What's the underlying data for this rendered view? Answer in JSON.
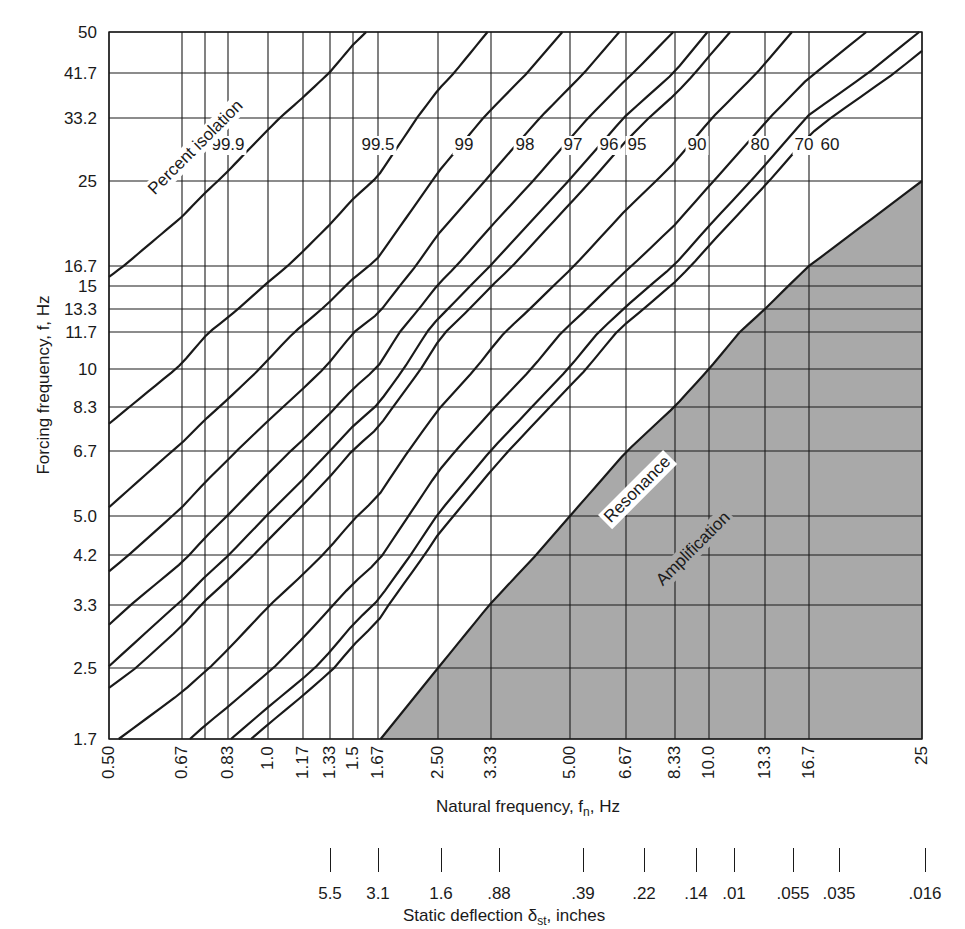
{
  "chart_data": {
    "type": "line",
    "title": "",
    "xlabel": "Natural frequency, fₙ, Hz",
    "ylabel": "Forcing frequency, f, Hz",
    "secondary_xlabel": "Static deflection δst, inches",
    "xscale": "log",
    "yscale": "log",
    "xlim": [
      0.5,
      25
    ],
    "ylim": [
      1.7,
      50
    ],
    "grid": true,
    "x_ticks": [
      {
        "value": 0.5,
        "label": "0.50",
        "px": 109
      },
      {
        "value": 0.67,
        "label": "0.67",
        "px": 182
      },
      {
        "value": 0.75,
        "label": "",
        "px": 205
      },
      {
        "value": 0.83,
        "label": "0.83",
        "px": 228
      },
      {
        "value": 1.0,
        "label": "1.0",
        "px": 268
      },
      {
        "value": 1.17,
        "label": "1.17",
        "px": 303
      },
      {
        "value": 1.33,
        "label": "1.33",
        "px": 330
      },
      {
        "value": 1.5,
        "label": "1.5",
        "px": 353
      },
      {
        "value": 1.67,
        "label": "1.67",
        "px": 378
      },
      {
        "value": 2.5,
        "label": "2.50",
        "px": 438
      },
      {
        "value": 3.33,
        "label": "3.33",
        "px": 491
      },
      {
        "value": 5.0,
        "label": "5.00",
        "px": 570
      },
      {
        "value": 6.67,
        "label": "6.67",
        "px": 626
      },
      {
        "value": 8.33,
        "label": "8.33",
        "px": 675
      },
      {
        "value": 10.0,
        "label": "10.0",
        "px": 709
      },
      {
        "value": 13.3,
        "label": "13.3",
        "px": 765
      },
      {
        "value": 16.7,
        "label": "16.7",
        "px": 809
      },
      {
        "value": 25,
        "label": "25",
        "px": 922
      }
    ],
    "y_ticks": [
      {
        "value": 50,
        "label": "50",
        "px": 32
      },
      {
        "value": 41.7,
        "label": "41.7",
        "px": 73
      },
      {
        "value": 33.2,
        "label": "33.2",
        "px": 118
      },
      {
        "value": 25,
        "label": "25",
        "px": 181
      },
      {
        "value": 16.7,
        "label": "16.7",
        "px": 266
      },
      {
        "value": 15,
        "label": "15",
        "px": 286
      },
      {
        "value": 13.3,
        "label": "13.3",
        "px": 309
      },
      {
        "value": 11.7,
        "label": "11.7",
        "px": 332
      },
      {
        "value": 10,
        "label": "10",
        "px": 369
      },
      {
        "value": 8.3,
        "label": "8.3",
        "px": 407
      },
      {
        "value": 6.7,
        "label": "6.7",
        "px": 451
      },
      {
        "value": 5.0,
        "label": "5.0",
        "px": 516
      },
      {
        "value": 4.2,
        "label": "4.2",
        "px": 555
      },
      {
        "value": 3.3,
        "label": "3.3",
        "px": 605
      },
      {
        "value": 2.5,
        "label": "2.5",
        "px": 668
      },
      {
        "value": 1.7,
        "label": "1.7",
        "px": 739
      }
    ],
    "static_deflection_scale": [
      {
        "label": "5.5",
        "px": 330
      },
      {
        "label": "3.1",
        "px": 378
      },
      {
        "label": "1.6",
        "px": 441
      },
      {
        "label": ".88",
        "px": 499
      },
      {
        "label": ".39",
        "px": 583
      },
      {
        "label": ".22",
        "px": 644
      },
      {
        "label": ".14",
        "px": 696
      },
      {
        "label": ".01",
        "px": 734
      },
      {
        "label": ".055",
        "px": 793
      },
      {
        "label": ".035",
        "px": 839
      },
      {
        "label": ".016",
        "px": 925
      }
    ],
    "series": [
      {
        "name": "99.9",
        "ratio": 31.5,
        "label_px": 228
      },
      {
        "name": "99.5",
        "ratio": 15.3,
        "label_px": 378
      },
      {
        "name": "99",
        "ratio": 10.4,
        "label_px": 464
      },
      {
        "name": "98",
        "ratio": 7.76,
        "label_px": 525
      },
      {
        "name": "97",
        "ratio": 6.05,
        "label_px": 573
      },
      {
        "name": "96",
        "ratio": 5.04,
        "label_px": 609
      },
      {
        "name": "95",
        "ratio": 4.49,
        "label_px": 637
      },
      {
        "name": "90",
        "ratio": 3.27,
        "label_px": 697
      },
      {
        "name": "80",
        "ratio": 2.44,
        "label_px": 760
      },
      {
        "name": "70",
        "ratio": 2.02,
        "label_px": 804
      },
      {
        "name": "60",
        "ratio": 1.84,
        "label_px": 830
      }
    ],
    "resonance_line": {
      "name": "Resonance",
      "ratio": 1.0
    },
    "annotations": [
      {
        "text": "Percent isolation",
        "region": "upper-left"
      },
      {
        "text": "Resonance",
        "region": "along f = fn"
      },
      {
        "text": "Amplification",
        "region": "shaded lower-right, f < fn"
      }
    ],
    "colors": {
      "line": "#1a1a1a",
      "shade": "#a9a9a9",
      "background": "#ffffff"
    }
  },
  "labels": {
    "y_title": "Forcing frequency, f, Hz",
    "x_title_main": "Natural frequency, f",
    "x_title_sub": "n",
    "x_title_unit": ", Hz",
    "d_title_main": "Static deflection δ",
    "d_title_sub": "st",
    "d_title_unit": ", inches",
    "percent_isolation": "Percent isolation",
    "resonance": "Resonance",
    "amplification": "Amplification"
  }
}
